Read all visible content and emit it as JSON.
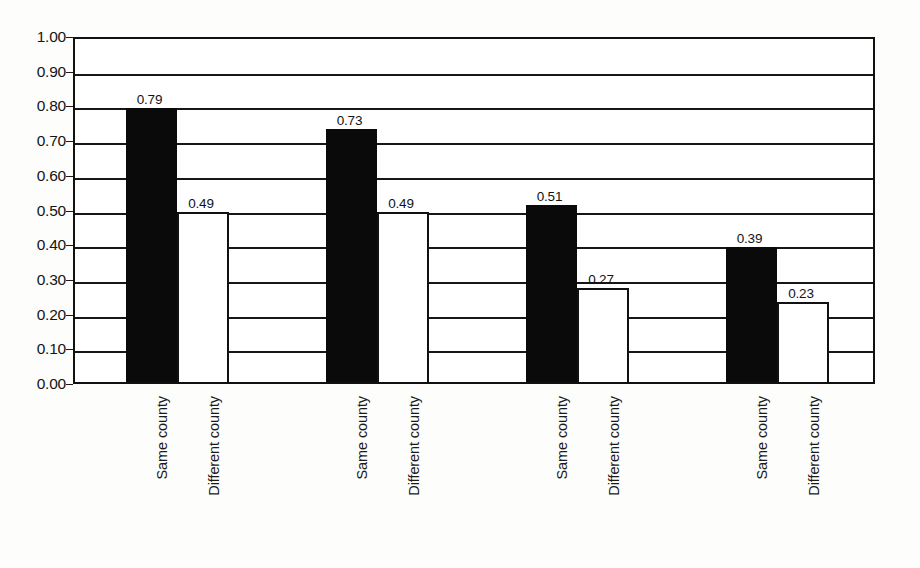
{
  "chart_data": {
    "type": "bar",
    "title": "",
    "subtitle": "",
    "xlabel": "",
    "ylabel": "",
    "ylim": [
      0.0,
      1.0
    ],
    "ytick_labels": [
      "1.00",
      "0.90",
      "0.80",
      "0.70",
      "0.60",
      "0.50",
      "0.40",
      "0.30",
      "0.20",
      "0.10",
      "0.00"
    ],
    "ytick_values": [
      1.0,
      0.9,
      0.8,
      0.7,
      0.6,
      0.5,
      0.4,
      0.3,
      0.2,
      0.1,
      0.0
    ],
    "grid": true,
    "legend": "none",
    "categories": [
      "Group 1",
      "Group 2",
      "Group 3",
      "Group 4"
    ],
    "series": [
      {
        "name": "Same county",
        "style": "filled-black",
        "values": [
          0.79,
          0.73,
          0.51,
          0.39
        ],
        "labels": [
          "0.79",
          "0.73",
          "0.51",
          "0.39"
        ]
      },
      {
        "name": "Different county",
        "style": "hollow-white",
        "values": [
          0.49,
          0.49,
          0.27,
          0.23
        ],
        "labels": [
          "0.49",
          "0.49",
          "0.27",
          "0.23"
        ]
      }
    ],
    "bars": [
      {
        "group": 0,
        "series": "Same county",
        "label": "0.79",
        "value": 0.79,
        "x": 124,
        "width": 51,
        "fill": "#0a0a0a"
      },
      {
        "group": 0,
        "series": "Different county",
        "label": "0.49",
        "value": 0.49,
        "x": 175,
        "width": 52,
        "fill": "#ffffff"
      },
      {
        "group": 1,
        "series": "Same county",
        "label": "0.73",
        "value": 0.73,
        "x": 324,
        "width": 51,
        "fill": "#0a0a0a"
      },
      {
        "group": 1,
        "series": "Different county",
        "label": "0.49",
        "value": 0.49,
        "x": 375,
        "width": 52,
        "fill": "#ffffff"
      },
      {
        "group": 2,
        "series": "Same county",
        "label": "0.51",
        "value": 0.51,
        "x": 524,
        "width": 51,
        "fill": "#0a0a0a"
      },
      {
        "group": 2,
        "series": "Different county",
        "label": "0.27",
        "value": 0.27,
        "x": 575,
        "width": 52,
        "fill": "#ffffff"
      },
      {
        "group": 3,
        "series": "Same county",
        "label": "0.39",
        "value": 0.39,
        "x": 724,
        "width": 51,
        "fill": "#0a0a0a"
      },
      {
        "group": 3,
        "series": "Different county",
        "label": "0.23",
        "value": 0.23,
        "x": 775,
        "width": 52,
        "fill": "#ffffff"
      }
    ],
    "category_labels": [
      {
        "text": "Same county",
        "x": 155
      },
      {
        "text": "Different county",
        "x": 207
      },
      {
        "text": "Same county",
        "x": 355
      },
      {
        "text": "Different county",
        "x": 407
      },
      {
        "text": "Same county",
        "x": 555
      },
      {
        "text": "Different county",
        "x": 607
      },
      {
        "text": "Same county",
        "x": 755
      },
      {
        "text": "Different county",
        "x": 807
      }
    ]
  },
  "colors": {
    "background": "#fdfdfc",
    "plot_background": "#ffffff",
    "axis": "#111111",
    "gridline": "#161616",
    "bar_filled": "#0a0a0a",
    "bar_hollow": "#ffffff",
    "text": "#151515"
  }
}
